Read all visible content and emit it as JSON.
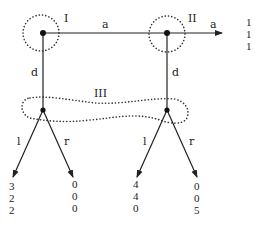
{
  "diagram": {
    "type": "extensive-form game tree",
    "players": [
      {
        "id": "I",
        "label": "I"
      },
      {
        "id": "II",
        "label": "II"
      },
      {
        "id": "III",
        "label": "III"
      }
    ],
    "nodes": {
      "I": {
        "label": "I",
        "x": 43,
        "y": 33
      },
      "II": {
        "label": "II",
        "x": 167,
        "y": 33
      },
      "III_left": {
        "x": 43,
        "y": 110
      },
      "III_right": {
        "x": 167,
        "y": 110
      }
    },
    "edges": {
      "I_a": {
        "label": "a"
      },
      "I_d": {
        "label": "d"
      },
      "II_a": {
        "label": "a"
      },
      "II_d": {
        "label": "d"
      },
      "IIIL_l": {
        "label": "l"
      },
      "IIIL_r": {
        "label": "r"
      },
      "IIIR_l": {
        "label": "l"
      },
      "IIIR_r": {
        "label": "r"
      }
    },
    "information_set_label": "III",
    "payoffs": {
      "II_a": [
        "1",
        "1",
        "1"
      ],
      "IIIL_l": [
        "3",
        "2",
        "2"
      ],
      "IIIL_r": [
        "0",
        "0",
        "0"
      ],
      "IIIR_l": [
        "4",
        "4",
        "0"
      ],
      "IIIR_r": [
        "0",
        "0",
        "5"
      ]
    },
    "colors": {
      "ink": "#222222",
      "background": "#ffffff"
    }
  }
}
